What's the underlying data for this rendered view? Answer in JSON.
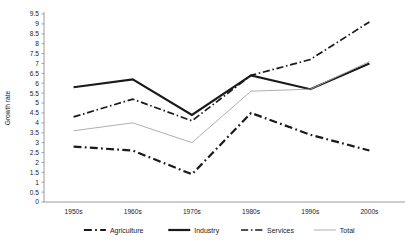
{
  "chart_data": {
    "type": "line",
    "title": "",
    "xlabel": "",
    "ylabel": "Growth rate",
    "categories": [
      "1950s",
      "1960s",
      "1970s",
      "1980s",
      "1990s",
      "2000s"
    ],
    "ylim": [
      0,
      9.5
    ],
    "ytick_step": 0.5,
    "yticks": [
      "9.5",
      "9",
      "8.5",
      "8",
      "7.5",
      "7",
      "6.5",
      "6",
      "5.5",
      "5",
      "4.5",
      "4",
      "3.5",
      "3",
      "2.5",
      "2",
      "1.5",
      "1",
      "0.5",
      "0"
    ],
    "grid": false,
    "legend_position": "bottom",
    "series": [
      {
        "name": "Agriculture",
        "values": [
          2.8,
          2.6,
          1.4,
          4.5,
          3.4,
          2.6
        ],
        "style": "dash-dot",
        "color": "#1a1a1a",
        "width": 2.2
      },
      {
        "name": "Industry",
        "values": [
          5.8,
          6.2,
          4.4,
          6.4,
          5.7,
          7.0
        ],
        "style": "solid",
        "color": "#1a1a1a",
        "width": 2.2
      },
      {
        "name": "Services",
        "values": [
          4.3,
          5.2,
          4.1,
          6.4,
          7.2,
          9.1
        ],
        "style": "dash-dot-short",
        "color": "#1a1a1a",
        "width": 1.7
      },
      {
        "name": "Total",
        "values": [
          3.6,
          4.0,
          3.0,
          5.6,
          5.7,
          7.1
        ],
        "style": "solid-thin",
        "color": "#a6a6a6",
        "width": 0.9
      }
    ]
  },
  "axis": {
    "y_title": "Growth rate"
  },
  "legend": {
    "items": [
      {
        "label": "Agriculture"
      },
      {
        "label": "Industry"
      },
      {
        "label": "Services"
      },
      {
        "label": "Total"
      }
    ]
  }
}
